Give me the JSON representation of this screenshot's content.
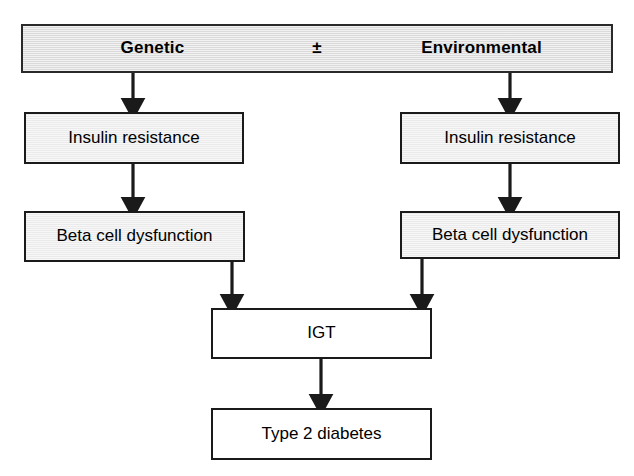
{
  "diagram": {
    "type": "flowchart",
    "colors": {
      "header_fill": "#e2e2e2",
      "branch_fill": "#efefef",
      "plain_fill": "#ffffff",
      "stroke": "#1a1a1a",
      "text": "#000000",
      "background": "#ffffff"
    },
    "header_bar": {
      "left_label": "Genetic",
      "operator": "±",
      "right_label": "Environmental"
    },
    "nodes": {
      "insulin_resistance_left": "Insulin resistance",
      "insulin_resistance_right": "Insulin resistance",
      "beta_cell_dysfunction_left": "Beta cell dysfunction",
      "beta_cell_dysfunction_right": "Beta cell dysfunction",
      "igt": "IGT",
      "type_2_diabetes": "Type 2 diabetes"
    },
    "edges": [
      {
        "from": "Genetic",
        "to": "Insulin resistance",
        "style": "arrow"
      },
      {
        "from": "Environmental",
        "to": "Insulin resistance",
        "style": "arrow"
      },
      {
        "from": "Insulin resistance",
        "to": "Beta cell dysfunction",
        "style": "arrow"
      },
      {
        "from": "Insulin resistance",
        "to": "Beta cell dysfunction",
        "style": "arrow"
      },
      {
        "from": "Beta cell dysfunction",
        "to": "IGT",
        "style": "arrow"
      },
      {
        "from": "Beta cell dysfunction",
        "to": "IGT",
        "style": "arrow"
      },
      {
        "from": "IGT",
        "to": "Type 2 diabetes",
        "style": "arrow"
      }
    ]
  }
}
